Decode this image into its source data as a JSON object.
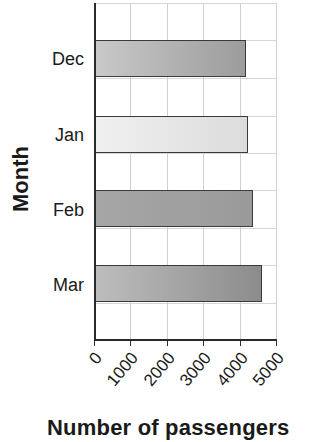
{
  "chart_data": {
    "type": "bar",
    "orientation": "horizontal",
    "title": "",
    "categories": [
      "Dec",
      "Jan",
      "Feb",
      "Mar"
    ],
    "values": [
      4150,
      4200,
      4350,
      4600
    ],
    "xlabel": "Number of passengers",
    "ylabel": "Month",
    "xlim": [
      0,
      5000
    ],
    "xticks": [
      "0",
      "1000",
      "2000",
      "3000",
      "4000",
      "5000"
    ],
    "grid": true,
    "legend": null,
    "bar_colors": [
      {
        "from": "#c9c9c9",
        "to": "#9c9c9c"
      },
      {
        "from": "#f0f0f0",
        "to": "#dcdcdc"
      },
      {
        "from": "#a6a6a6",
        "to": "#9a9a9a"
      },
      {
        "from": "#bdbdbd",
        "to": "#8c8c8c"
      }
    ]
  },
  "axes": {
    "x_title": "Number of passengers",
    "y_title": "Month",
    "x_ticks": [
      "0",
      "1000",
      "2000",
      "3000",
      "4000",
      "5000"
    ],
    "categories": [
      "Dec",
      "Jan",
      "Feb",
      "Mar"
    ]
  }
}
